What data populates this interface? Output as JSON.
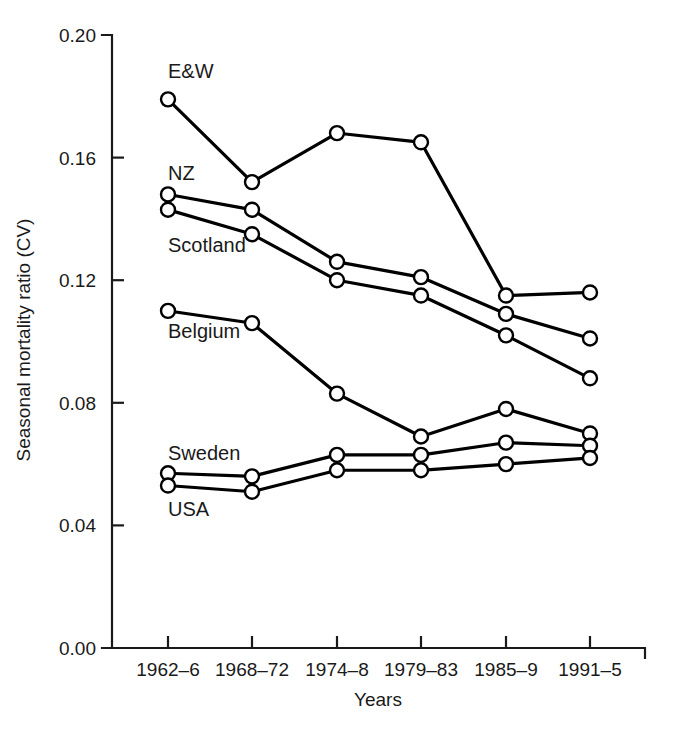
{
  "chart_data": {
    "type": "line",
    "title": "",
    "xlabel": "Years",
    "ylabel": "Seasonal mortality ratio (CV)",
    "categories": [
      "1962–6",
      "1968–72",
      "1974–8",
      "1979–83",
      "1985–9",
      "1991–5"
    ],
    "ylim": [
      0.0,
      0.2
    ],
    "yticks": [
      "0.00",
      "0.04",
      "0.08",
      "0.12",
      "0.16",
      "0.20"
    ],
    "ytick_values": [
      0.0,
      0.04,
      0.08,
      0.12,
      0.16,
      0.2
    ],
    "grid": false,
    "legend": "inline-labels-left",
    "marker": "open-circle",
    "line_color": "#000000",
    "marker_fill": "#ffffff",
    "series": [
      {
        "name": "E&W",
        "label": "E&W",
        "label_x": 168,
        "label_y": 78,
        "values": [
          0.179,
          0.152,
          0.168,
          0.165,
          0.115,
          0.116
        ]
      },
      {
        "name": "NZ",
        "label": "NZ",
        "label_x": 168,
        "label_y": 180,
        "values": [
          0.148,
          0.143,
          0.126,
          0.121,
          0.109,
          0.101
        ]
      },
      {
        "name": "Scotland",
        "label": "Scotland",
        "label_x": 168,
        "label_y": 252,
        "values": [
          0.143,
          0.135,
          0.12,
          0.115,
          0.102,
          0.088
        ]
      },
      {
        "name": "Belgium",
        "label": "Belgium",
        "label_x": 168,
        "label_y": 338,
        "values": [
          0.11,
          0.106,
          0.083,
          0.069,
          0.078,
          0.07
        ]
      },
      {
        "name": "Sweden",
        "label": "Sweden",
        "label_x": 168,
        "label_y": 460,
        "values": [
          0.057,
          0.056,
          0.063,
          0.063,
          0.067,
          0.066
        ]
      },
      {
        "name": "USA",
        "label": "USA",
        "label_x": 168,
        "label_y": 516,
        "values": [
          0.053,
          0.051,
          0.058,
          0.058,
          0.06,
          0.062
        ]
      }
    ]
  }
}
